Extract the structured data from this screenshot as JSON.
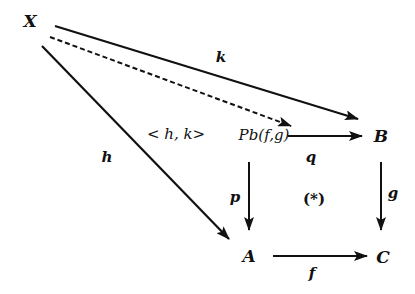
{
  "diagram": {
    "nodes": {
      "X": {
        "label": "X",
        "x": 30,
        "y": 20
      },
      "Pb": {
        "label": "Pb(f,g)",
        "x": 264,
        "y": 135
      },
      "B": {
        "label": "B",
        "x": 380,
        "y": 135
      },
      "A": {
        "label": "A",
        "x": 249,
        "y": 256
      },
      "C": {
        "label": "C",
        "x": 381,
        "y": 256
      }
    },
    "edges": {
      "k": {
        "label": "k",
        "from": "X",
        "to": "B",
        "style": "solid"
      },
      "hk": {
        "label": "< h, k>",
        "from": "X",
        "to": "Pb",
        "style": "dashed"
      },
      "h": {
        "label": "h",
        "from": "X",
        "to": "A",
        "style": "solid"
      },
      "q": {
        "label": "q",
        "from": "Pb",
        "to": "B",
        "style": "solid"
      },
      "p": {
        "label": "p",
        "from": "Pb",
        "to": "A",
        "style": "solid"
      },
      "g": {
        "label": "g",
        "from": "B",
        "to": "C",
        "style": "solid"
      },
      "f": {
        "label": "f",
        "from": "A",
        "to": "C",
        "style": "solid"
      }
    },
    "annotation": "(*)",
    "stroke_color": "#111111"
  }
}
